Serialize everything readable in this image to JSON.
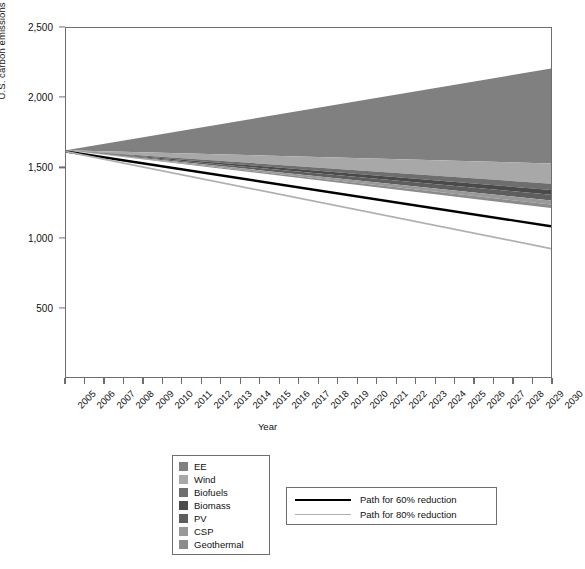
{
  "chart_data": {
    "type": "area",
    "title": "",
    "xlabel": "Year",
    "ylabel": "U.S. carbon emissions (MtC/yr)",
    "xlim": [
      2005,
      2030
    ],
    "ylim": [
      0,
      2500
    ],
    "ytick_labels": [
      "500",
      "1,000",
      "1,500",
      "2,000",
      "2,500"
    ],
    "ytick_values": [
      500,
      1000,
      1500,
      2000,
      2500
    ],
    "xtick_labels": [
      "2005",
      "2006",
      "2007",
      "2008",
      "2009",
      "2010",
      "2011",
      "2012",
      "2013",
      "2014",
      "2015",
      "2016",
      "2017",
      "2018",
      "2019",
      "2020",
      "2021",
      "2022",
      "2023",
      "2024",
      "2025",
      "2026",
      "2027",
      "2028",
      "2029",
      "2030"
    ],
    "grid": false,
    "legend_position": "below-plot",
    "baseline_2005": 1625,
    "bau_2030": 2210,
    "stack_note": "Stacked mitigation wedges measured downward from the business-as-usual emissions trajectory; all wedges converge to zero width in 2005.",
    "series": [
      {
        "name": "Business as usual",
        "kind": "upper-envelope",
        "color": "#ffffff",
        "x": [
          2005,
          2030
        ],
        "values": [
          1625,
          2210
        ]
      },
      {
        "name": "EE",
        "kind": "wedge",
        "color": "#808080",
        "x": [
          2005,
          2030
        ],
        "wedge_width_2030": 680,
        "top_values": [
          1625,
          2210
        ],
        "bottom_values": [
          1625,
          1530
        ]
      },
      {
        "name": "Wind",
        "kind": "wedge",
        "color": "#a8a8a8",
        "x": [
          2005,
          2030
        ],
        "wedge_width_2030": 145,
        "top_values": [
          1625,
          1530
        ],
        "bottom_values": [
          1625,
          1385
        ]
      },
      {
        "name": "Biofuels",
        "kind": "wedge",
        "color": "#6e6e6e",
        "x": [
          2005,
          2030
        ],
        "wedge_width_2030": 45,
        "top_values": [
          1625,
          1385
        ],
        "bottom_values": [
          1625,
          1340
        ]
      },
      {
        "name": "Biomass",
        "kind": "wedge",
        "color": "#4a4a4a",
        "x": [
          2005,
          2030
        ],
        "wedge_width_2030": 35,
        "top_values": [
          1625,
          1340
        ],
        "bottom_values": [
          1625,
          1305
        ]
      },
      {
        "name": "PV",
        "kind": "wedge",
        "color": "#5e5e5e",
        "x": [
          2005,
          2030
        ],
        "wedge_width_2030": 40,
        "top_values": [
          1625,
          1305
        ],
        "bottom_values": [
          1625,
          1265
        ]
      },
      {
        "name": "CSP",
        "kind": "wedge",
        "color": "#999999",
        "x": [
          2005,
          2030
        ],
        "wedge_width_2030": 30,
        "top_values": [
          1625,
          1265
        ],
        "bottom_values": [
          1625,
          1235
        ]
      },
      {
        "name": "Geothermal",
        "kind": "wedge",
        "color": "#8c8c8c",
        "x": [
          2005,
          2030
        ],
        "wedge_width_2030": 25,
        "top_values": [
          1625,
          1235
        ],
        "bottom_values": [
          1625,
          1210
        ]
      },
      {
        "name": "Path for 60% reduction",
        "kind": "line",
        "color": "#000000",
        "x": [
          2005,
          2030
        ],
        "values": [
          1615,
          1080
        ]
      },
      {
        "name": "Path for 80% reduction",
        "kind": "line",
        "color": "#b0b0b0",
        "x": [
          2005,
          2030
        ],
        "values": [
          1615,
          920
        ]
      }
    ]
  },
  "axes": {
    "y_title": "U.S. carbon emissions (MtC/yr)",
    "x_title": "Year"
  },
  "legend_wedges": {
    "items": [
      {
        "label": "EE",
        "color": "#808080"
      },
      {
        "label": "Wind",
        "color": "#a8a8a8"
      },
      {
        "label": "Biofuels",
        "color": "#6e6e6e"
      },
      {
        "label": "Biomass",
        "color": "#4a4a4a"
      },
      {
        "label": "PV",
        "color": "#5e5e5e"
      },
      {
        "label": "CSP",
        "color": "#999999"
      },
      {
        "label": "Geothermal",
        "color": "#8c8c8c"
      }
    ]
  },
  "legend_paths": {
    "items": [
      {
        "label": "Path for 60% reduction",
        "color": "#000000",
        "style": "thick"
      },
      {
        "label": "Path for 80% reduction",
        "color": "#b0b0b0",
        "style": "thin"
      }
    ]
  }
}
